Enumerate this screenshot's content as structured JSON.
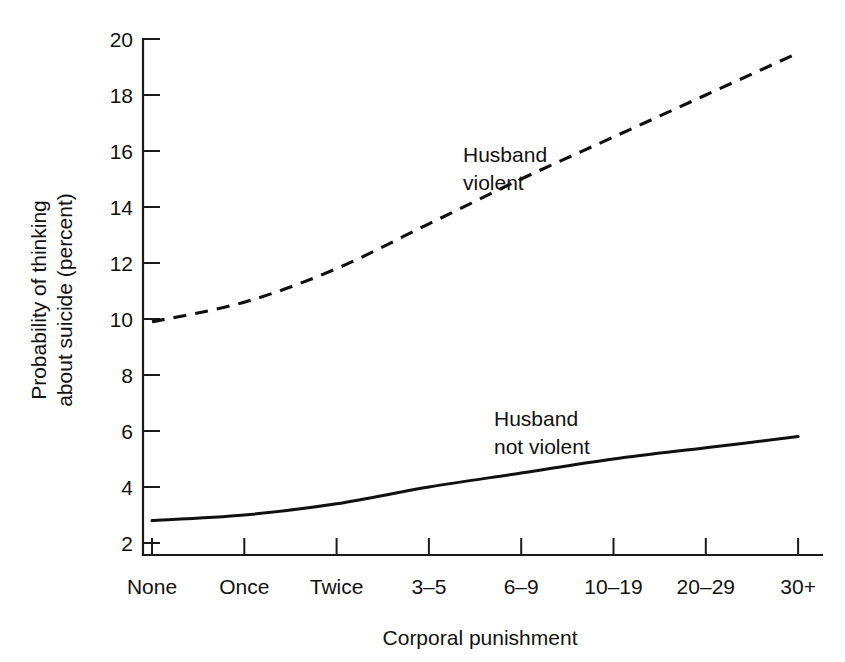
{
  "chart_data": {
    "type": "line",
    "title": "",
    "xlabel": "Corporal punishment",
    "ylabel_line1": "Probability of thinking",
    "ylabel_line2": "about suicide (percent)",
    "categories": [
      "None",
      "Once",
      "Twice",
      "3–5",
      "6–9",
      "10–19",
      "20–29",
      "30+"
    ],
    "ylim": [
      2,
      20
    ],
    "yticks": [
      2,
      4,
      6,
      8,
      10,
      12,
      14,
      16,
      18,
      20
    ],
    "ytick_labels": [
      "2",
      "4",
      "6",
      "8",
      "10",
      "12",
      "14",
      "16",
      "18",
      "20"
    ],
    "grid": false,
    "legend_position": "inline-annotations",
    "series": [
      {
        "name": "Husband violent",
        "style": "dashed",
        "color": "#101010",
        "label_line1": "Husband",
        "label_line2": "violent",
        "values": [
          9.9,
          10.6,
          11.8,
          13.4,
          15.0,
          16.5,
          18.0,
          19.5
        ]
      },
      {
        "name": "Husband not violent",
        "style": "solid",
        "color": "#101010",
        "label_line1": "Husband",
        "label_line2": "not violent",
        "values": [
          2.8,
          3.0,
          3.4,
          4.0,
          4.5,
          5.0,
          5.4,
          5.8
        ]
      }
    ],
    "annotations": [
      {
        "text_line1": "Husband",
        "text_line2": "violent",
        "series": "Husband violent"
      },
      {
        "text_line1": "Husband",
        "text_line2": "not violent",
        "series": "Husband not violent"
      }
    ]
  }
}
